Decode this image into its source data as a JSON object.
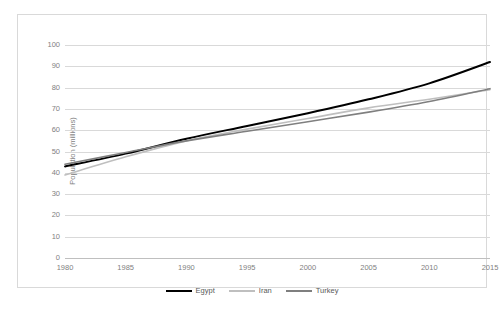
{
  "chart_data": {
    "type": "line",
    "title": "",
    "xlabel": "",
    "ylabel": "Population (millions)",
    "xlim": [
      1980,
      2015
    ],
    "ylim": [
      0,
      100
    ],
    "ytick_step": 10,
    "xtick_step": 5,
    "grid": true,
    "legend_position": "bottom",
    "x": [
      1980,
      1985,
      1990,
      1995,
      2000,
      2005,
      2010,
      2015
    ],
    "yticks": [
      0,
      10,
      20,
      30,
      40,
      50,
      60,
      70,
      80,
      90,
      100
    ],
    "xticks": [
      1980,
      1985,
      1990,
      1995,
      2000,
      2005,
      2010,
      2015
    ],
    "series": [
      {
        "name": "Egypt",
        "color": "#000000",
        "width": 2.0,
        "values": [
          43.0,
          49.0,
          56.0,
          62.0,
          68.0,
          74.5,
          82.0,
          92.0
        ]
      },
      {
        "name": "Iran",
        "color": "#bfbfbf",
        "width": 1.6,
        "values": [
          39.0,
          47.5,
          55.0,
          60.5,
          65.5,
          70.5,
          74.5,
          79.0
        ]
      },
      {
        "name": "Turkey",
        "color": "#7f7f7f",
        "width": 1.6,
        "values": [
          44.0,
          49.5,
          55.0,
          59.5,
          64.0,
          68.5,
          73.5,
          79.5
        ]
      }
    ]
  },
  "axes": {
    "y_axis_title": "Population (millions)"
  },
  "legend": {
    "items": [
      {
        "label": "Egypt"
      },
      {
        "label": "Iran"
      },
      {
        "label": "Turkey"
      }
    ]
  },
  "caption": {
    "text": ""
  },
  "colors": {
    "grid": "#d9d9d9",
    "axis": "#bfbfbf",
    "tick_text": "#7f7f7f",
    "border": "#d9d9d9",
    "egypt": "#000000",
    "iran": "#bfbfbf",
    "turkey": "#7f7f7f"
  }
}
